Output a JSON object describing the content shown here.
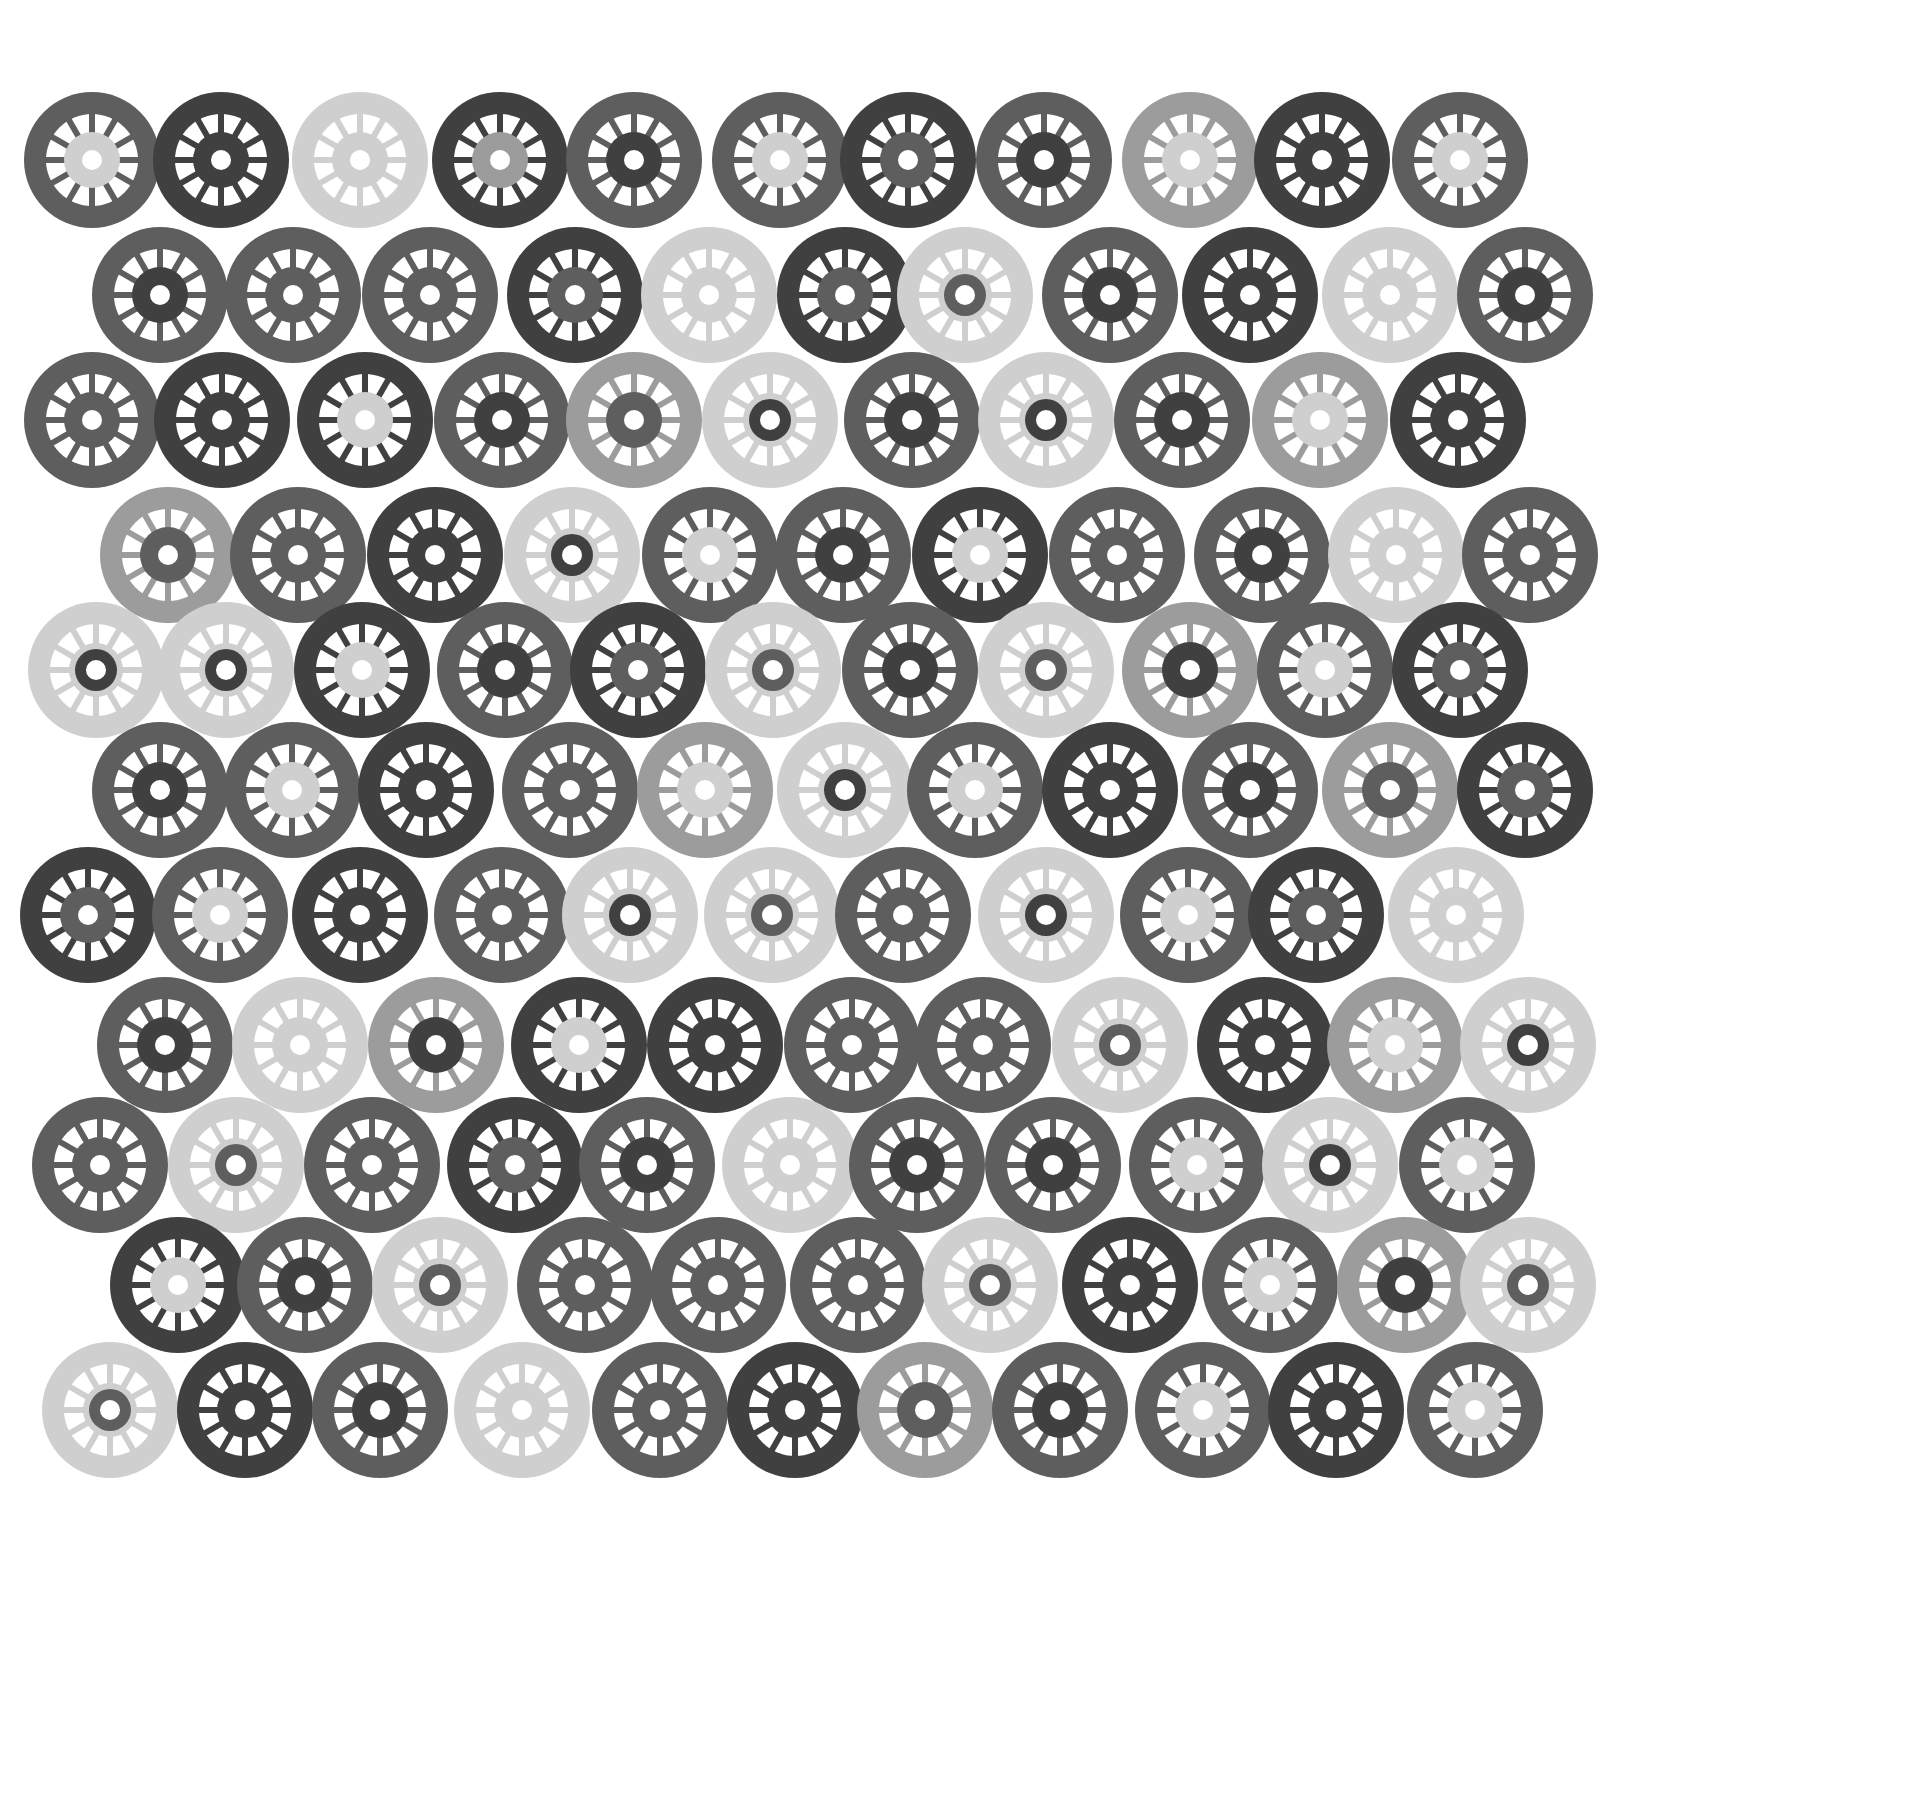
{
  "palette": {
    "D": "#404040",
    "M": "#5e5e5e",
    "L": "#9c9c9c",
    "P": "#cfcfcf",
    "background": "#ffffff"
  },
  "wheel_geometry": {
    "outer_radius": 68,
    "window_outer": 46,
    "window_inner": 27,
    "hub_radius_large": 28,
    "hub_radius_small": 21,
    "hole_radius": 10,
    "spokes": 12,
    "spoke_width": 6
  },
  "rows": [
    {
      "y": 160,
      "wheels": [
        {
          "x": 92,
          "ring": "M",
          "hub": "P"
        },
        {
          "x": 221,
          "ring": "D",
          "hub": "D"
        },
        {
          "x": 360,
          "ring": "P",
          "hub": "P"
        },
        {
          "x": 500,
          "ring": "D",
          "hub": "L"
        },
        {
          "x": 634,
          "ring": "M",
          "hub": "D"
        },
        {
          "x": 780,
          "ring": "M",
          "hub": "P"
        },
        {
          "x": 908,
          "ring": "D",
          "hub": "M"
        },
        {
          "x": 1044,
          "ring": "M",
          "hub": "D"
        },
        {
          "x": 1190,
          "ring": "L",
          "hub": "P"
        },
        {
          "x": 1322,
          "ring": "D",
          "hub": "D"
        },
        {
          "x": 1460,
          "ring": "M",
          "hub": "P"
        }
      ]
    },
    {
      "y": 295,
      "wheels": [
        {
          "x": 160,
          "ring": "M",
          "hub": "D"
        },
        {
          "x": 293,
          "ring": "M",
          "hub": "M"
        },
        {
          "x": 430,
          "ring": "M",
          "hub": "M"
        },
        {
          "x": 575,
          "ring": "D",
          "hub": "M"
        },
        {
          "x": 709,
          "ring": "P",
          "hub": "P"
        },
        {
          "x": 845,
          "ring": "D",
          "hub": "M"
        },
        {
          "x": 965,
          "ring": "P",
          "hub": "M",
          "small": true
        },
        {
          "x": 1110,
          "ring": "M",
          "hub": "D"
        },
        {
          "x": 1250,
          "ring": "D",
          "hub": "D"
        },
        {
          "x": 1390,
          "ring": "P",
          "hub": "P"
        },
        {
          "x": 1525,
          "ring": "M",
          "hub": "D"
        }
      ]
    },
    {
      "y": 420,
      "wheels": [
        {
          "x": 92,
          "ring": "M",
          "hub": "M"
        },
        {
          "x": 222,
          "ring": "D",
          "hub": "D"
        },
        {
          "x": 365,
          "ring": "D",
          "hub": "P"
        },
        {
          "x": 502,
          "ring": "M",
          "hub": "D"
        },
        {
          "x": 634,
          "ring": "L",
          "hub": "M"
        },
        {
          "x": 770,
          "ring": "P",
          "hub": "D",
          "small": true
        },
        {
          "x": 912,
          "ring": "M",
          "hub": "D"
        },
        {
          "x": 1046,
          "ring": "P",
          "hub": "D",
          "small": true
        },
        {
          "x": 1182,
          "ring": "M",
          "hub": "D"
        },
        {
          "x": 1320,
          "ring": "L",
          "hub": "P"
        },
        {
          "x": 1458,
          "ring": "D",
          "hub": "D"
        }
      ]
    },
    {
      "y": 555,
      "wheels": [
        {
          "x": 168,
          "ring": "L",
          "hub": "M"
        },
        {
          "x": 298,
          "ring": "M",
          "hub": "M"
        },
        {
          "x": 435,
          "ring": "D",
          "hub": "D"
        },
        {
          "x": 572,
          "ring": "P",
          "hub": "D",
          "small": true
        },
        {
          "x": 710,
          "ring": "M",
          "hub": "P"
        },
        {
          "x": 843,
          "ring": "M",
          "hub": "D"
        },
        {
          "x": 980,
          "ring": "D",
          "hub": "P"
        },
        {
          "x": 1117,
          "ring": "M",
          "hub": "M"
        },
        {
          "x": 1262,
          "ring": "M",
          "hub": "D"
        },
        {
          "x": 1396,
          "ring": "P",
          "hub": "P"
        },
        {
          "x": 1530,
          "ring": "M",
          "hub": "M"
        }
      ]
    },
    {
      "y": 670,
      "wheels": [
        {
          "x": 96,
          "ring": "P",
          "hub": "D",
          "small": true
        },
        {
          "x": 226,
          "ring": "P",
          "hub": "D",
          "small": true
        },
        {
          "x": 362,
          "ring": "D",
          "hub": "P"
        },
        {
          "x": 505,
          "ring": "M",
          "hub": "D"
        },
        {
          "x": 638,
          "ring": "D",
          "hub": "M"
        },
        {
          "x": 773,
          "ring": "P",
          "hub": "M",
          "small": true
        },
        {
          "x": 910,
          "ring": "M",
          "hub": "D"
        },
        {
          "x": 1046,
          "ring": "P",
          "hub": "M",
          "small": true
        },
        {
          "x": 1190,
          "ring": "L",
          "hub": "D"
        },
        {
          "x": 1325,
          "ring": "M",
          "hub": "P"
        },
        {
          "x": 1460,
          "ring": "D",
          "hub": "M"
        }
      ]
    },
    {
      "y": 790,
      "wheels": [
        {
          "x": 160,
          "ring": "M",
          "hub": "D"
        },
        {
          "x": 292,
          "ring": "M",
          "hub": "P"
        },
        {
          "x": 426,
          "ring": "D",
          "hub": "D"
        },
        {
          "x": 570,
          "ring": "M",
          "hub": "M"
        },
        {
          "x": 705,
          "ring": "L",
          "hub": "P"
        },
        {
          "x": 845,
          "ring": "P",
          "hub": "D",
          "small": true
        },
        {
          "x": 975,
          "ring": "M",
          "hub": "P"
        },
        {
          "x": 1110,
          "ring": "D",
          "hub": "D"
        },
        {
          "x": 1250,
          "ring": "M",
          "hub": "D"
        },
        {
          "x": 1390,
          "ring": "L",
          "hub": "M"
        },
        {
          "x": 1525,
          "ring": "D",
          "hub": "M"
        }
      ]
    },
    {
      "y": 915,
      "wheels": [
        {
          "x": 88,
          "ring": "D",
          "hub": "M"
        },
        {
          "x": 220,
          "ring": "M",
          "hub": "P"
        },
        {
          "x": 360,
          "ring": "D",
          "hub": "D"
        },
        {
          "x": 502,
          "ring": "M",
          "hub": "M"
        },
        {
          "x": 630,
          "ring": "P",
          "hub": "D",
          "small": true
        },
        {
          "x": 772,
          "ring": "P",
          "hub": "M",
          "small": true
        },
        {
          "x": 903,
          "ring": "M",
          "hub": "M"
        },
        {
          "x": 1046,
          "ring": "P",
          "hub": "D",
          "small": true
        },
        {
          "x": 1188,
          "ring": "M",
          "hub": "P"
        },
        {
          "x": 1316,
          "ring": "D",
          "hub": "M"
        },
        {
          "x": 1456,
          "ring": "P",
          "hub": "P"
        }
      ]
    },
    {
      "y": 1045,
      "wheels": [
        {
          "x": 165,
          "ring": "M",
          "hub": "D"
        },
        {
          "x": 300,
          "ring": "P",
          "hub": "P"
        },
        {
          "x": 436,
          "ring": "L",
          "hub": "D"
        },
        {
          "x": 579,
          "ring": "D",
          "hub": "P"
        },
        {
          "x": 715,
          "ring": "D",
          "hub": "D"
        },
        {
          "x": 852,
          "ring": "M",
          "hub": "M"
        },
        {
          "x": 983,
          "ring": "M",
          "hub": "M"
        },
        {
          "x": 1120,
          "ring": "P",
          "hub": "M",
          "small": true
        },
        {
          "x": 1265,
          "ring": "D",
          "hub": "D"
        },
        {
          "x": 1395,
          "ring": "L",
          "hub": "P"
        },
        {
          "x": 1528,
          "ring": "P",
          "hub": "D",
          "small": true
        }
      ]
    },
    {
      "y": 1165,
      "wheels": [
        {
          "x": 100,
          "ring": "M",
          "hub": "M"
        },
        {
          "x": 236,
          "ring": "P",
          "hub": "M",
          "small": true
        },
        {
          "x": 372,
          "ring": "M",
          "hub": "M"
        },
        {
          "x": 515,
          "ring": "D",
          "hub": "M"
        },
        {
          "x": 647,
          "ring": "M",
          "hub": "D"
        },
        {
          "x": 790,
          "ring": "P",
          "hub": "P"
        },
        {
          "x": 917,
          "ring": "M",
          "hub": "D"
        },
        {
          "x": 1053,
          "ring": "M",
          "hub": "D"
        },
        {
          "x": 1197,
          "ring": "M",
          "hub": "P"
        },
        {
          "x": 1330,
          "ring": "P",
          "hub": "D",
          "small": true
        },
        {
          "x": 1467,
          "ring": "M",
          "hub": "P"
        }
      ]
    },
    {
      "y": 1285,
      "wheels": [
        {
          "x": 178,
          "ring": "D",
          "hub": "P"
        },
        {
          "x": 305,
          "ring": "M",
          "hub": "D"
        },
        {
          "x": 440,
          "ring": "P",
          "hub": "M",
          "small": true
        },
        {
          "x": 585,
          "ring": "M",
          "hub": "M"
        },
        {
          "x": 718,
          "ring": "M",
          "hub": "M"
        },
        {
          "x": 858,
          "ring": "M",
          "hub": "M"
        },
        {
          "x": 990,
          "ring": "P",
          "hub": "M",
          "small": true
        },
        {
          "x": 1130,
          "ring": "D",
          "hub": "D"
        },
        {
          "x": 1270,
          "ring": "M",
          "hub": "P"
        },
        {
          "x": 1405,
          "ring": "L",
          "hub": "D"
        },
        {
          "x": 1528,
          "ring": "P",
          "hub": "M",
          "small": true
        }
      ]
    },
    {
      "y": 1410,
      "wheels": [
        {
          "x": 110,
          "ring": "P",
          "hub": "M",
          "small": true
        },
        {
          "x": 245,
          "ring": "D",
          "hub": "D"
        },
        {
          "x": 380,
          "ring": "M",
          "hub": "D"
        },
        {
          "x": 522,
          "ring": "P",
          "hub": "P"
        },
        {
          "x": 660,
          "ring": "M",
          "hub": "M"
        },
        {
          "x": 795,
          "ring": "D",
          "hub": "D"
        },
        {
          "x": 925,
          "ring": "L",
          "hub": "M"
        },
        {
          "x": 1060,
          "ring": "M",
          "hub": "D"
        },
        {
          "x": 1203,
          "ring": "M",
          "hub": "P"
        },
        {
          "x": 1336,
          "ring": "D",
          "hub": "D"
        },
        {
          "x": 1475,
          "ring": "M",
          "hub": "P"
        }
      ]
    }
  ]
}
